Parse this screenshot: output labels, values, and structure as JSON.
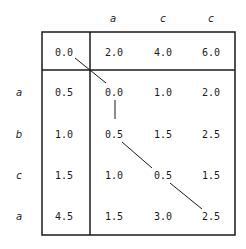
{
  "matrix": {
    "column_headers": [
      "a",
      "c",
      "c"
    ],
    "row_headers": [
      "a",
      "b",
      "c",
      "a"
    ],
    "first_row": [
      "0.0",
      "2.0",
      "4.0",
      "6.0"
    ],
    "rows": [
      [
        "0.5",
        "0.0",
        "1.0",
        "2.0"
      ],
      [
        "1.0",
        "0.5",
        "1.5",
        "2.5"
      ],
      [
        "1.5",
        "1.0",
        "0.5",
        "1.5"
      ],
      [
        "4.5",
        "1.5",
        "3.0",
        "2.5"
      ]
    ]
  },
  "colors": {
    "line": "#1a1a1a",
    "background": "#ffffff"
  }
}
